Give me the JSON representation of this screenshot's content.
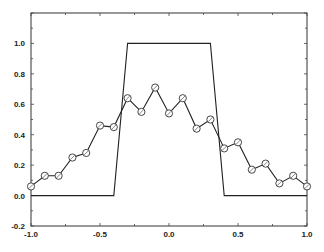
{
  "chart_data": {
    "type": "line",
    "title": "",
    "xlabel": "",
    "ylabel": "",
    "xlim": [
      -1.0,
      1.0
    ],
    "ylim": [
      -0.2,
      1.2
    ],
    "grid": false,
    "legend": null,
    "x_ticks": [
      "-1.0",
      "-0.5",
      "0.0",
      "0.5",
      "1.0"
    ],
    "y_ticks": [
      "-0.2",
      "0.0",
      "0.2",
      "0.4",
      "0.6",
      "0.8",
      "1.0"
    ],
    "series": [
      {
        "name": "rectangular pulse",
        "marker": "none",
        "x": [
          -1.0,
          -0.4,
          -0.3,
          0.3,
          0.4,
          1.0
        ],
        "values": [
          0.0,
          0.0,
          1.0,
          1.0,
          0.0,
          0.0
        ]
      },
      {
        "name": "sampled approximation",
        "marker": "circle",
        "x": [
          -1.0,
          -0.9,
          -0.8,
          -0.7,
          -0.6,
          -0.5,
          -0.4,
          -0.3,
          -0.2,
          -0.1,
          0.0,
          0.1,
          0.2,
          0.3,
          0.4,
          0.5,
          0.6,
          0.7,
          0.8,
          0.9,
          1.0
        ],
        "values": [
          0.06,
          0.13,
          0.13,
          0.25,
          0.28,
          0.46,
          0.45,
          0.64,
          0.55,
          0.71,
          0.54,
          0.64,
          0.44,
          0.5,
          0.31,
          0.35,
          0.17,
          0.21,
          0.08,
          0.13,
          0.06
        ]
      }
    ]
  },
  "style": {
    "line_color": "#222222",
    "marker_color": "#333333",
    "background": "#ffffff"
  }
}
